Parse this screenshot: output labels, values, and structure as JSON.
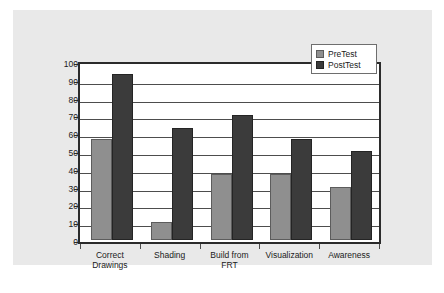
{
  "chart_data": {
    "type": "bar",
    "title": "",
    "subtitle": "",
    "xlabel": "",
    "ylabel": "",
    "categories": [
      "Correct Drawings",
      "Shading",
      "Build from FRT",
      "Visualization",
      "Awareness"
    ],
    "category_lines": [
      [
        "Correct",
        "Drawings"
      ],
      [
        "Shading"
      ],
      [
        "Build from",
        "FRT"
      ],
      [
        "Visualization"
      ],
      [
        "Awareness"
      ]
    ],
    "series": [
      {
        "name": "PreTest",
        "values": [
          57,
          10,
          37,
          37,
          30
        ],
        "color": "#8f8f8f"
      },
      {
        "name": "PostTest",
        "values": [
          93,
          63,
          70,
          57,
          50
        ],
        "color": "#3b3b3b"
      }
    ],
    "ylim": [
      0,
      100
    ],
    "ytick_step": 10,
    "yticks": [
      "100",
      "90",
      "80",
      "70",
      "60",
      "50",
      "40",
      "30",
      "20",
      "10",
      "0"
    ],
    "grid": true,
    "grid_axis": "y",
    "legend_position": "top-right"
  },
  "legend": {
    "entries": [
      {
        "label": "PreTest",
        "swatch": "pretest-swatch"
      },
      {
        "label": "PostTest",
        "swatch": "posttest-swatch"
      }
    ]
  },
  "colors": {
    "panel_background": "#e9e9e9",
    "plot_background": "#ffffff",
    "axis": "#2b2b2b",
    "gridline": "#4d4d4d",
    "pretest_bar": "#8f8f8f",
    "posttest_bar": "#3b3b3b",
    "text": "#1a1a1a"
  }
}
